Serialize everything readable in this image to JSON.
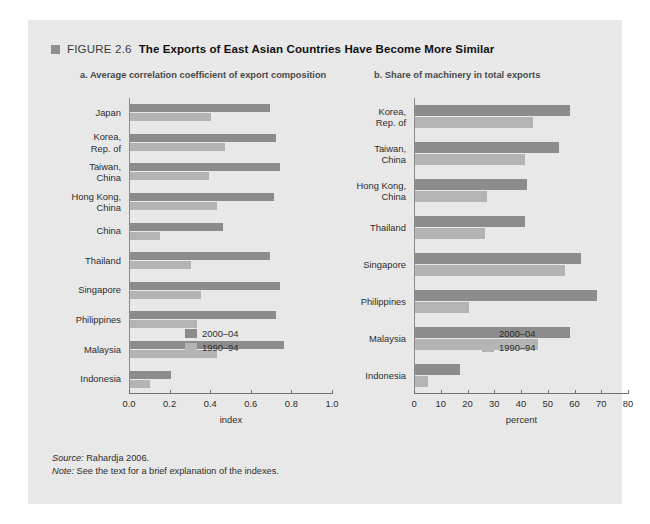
{
  "figure": {
    "marker": "square-marker-icon",
    "label": "FIGURE 2.6",
    "title": "The Exports of East Asian Countries Have Become More Similar"
  },
  "notes": {
    "source_key": "Source:",
    "source_value": " Rahardja 2006.",
    "note_key": "Note:",
    "note_value": " See the text for a brief explanation of the indexes."
  },
  "legend": {
    "new_label": "2000–04",
    "old_label": "1990–94",
    "new_color": "#8c8c8c",
    "old_color": "#b4b4b4"
  },
  "chart_data": [
    {
      "type": "bar",
      "panel": "a",
      "title": "a. Average correlation coefficient of export composition",
      "orientation": "horizontal",
      "xlabel": "index",
      "ylabel": "",
      "xlim": [
        0.0,
        1.0
      ],
      "ticks": [
        "0.0",
        "0.2",
        "0.4",
        "0.6",
        "0.8",
        "1.0"
      ],
      "tick_values": [
        0.0,
        0.2,
        0.4,
        0.6,
        0.8,
        1.0
      ],
      "grid": false,
      "legend_position": "inside-bottom-right",
      "categories": [
        "Japan",
        "Korea,\nRep. of",
        "Taiwan,\nChina",
        "Hong Kong,\nChina",
        "China",
        "Thailand",
        "Singapore",
        "Philippines",
        "Malaysia",
        "Indonesia"
      ],
      "series": [
        {
          "name": "2000–04",
          "values": [
            0.69,
            0.72,
            0.74,
            0.71,
            0.46,
            0.69,
            0.74,
            0.72,
            0.76,
            0.2
          ]
        },
        {
          "name": "1990–94",
          "values": [
            0.4,
            0.47,
            0.39,
            0.43,
            0.15,
            0.3,
            0.35,
            0.33,
            0.43,
            0.1
          ]
        }
      ]
    },
    {
      "type": "bar",
      "panel": "b",
      "title": "b. Share of machinery in total exports",
      "orientation": "horizontal",
      "xlabel": "percent",
      "ylabel": "",
      "xlim": [
        0,
        80
      ],
      "ticks": [
        "0",
        "10",
        "20",
        "30",
        "40",
        "50",
        "60",
        "70",
        "80"
      ],
      "tick_values": [
        0,
        10,
        20,
        30,
        40,
        50,
        60,
        70,
        80
      ],
      "grid": false,
      "legend_position": "inside-bottom-right",
      "categories": [
        "Korea,\nRep. of",
        "Taiwan,\nChina",
        "Hong Kong,\nChina",
        "Thailand",
        "Singapore",
        "Philippines",
        "Malaysia",
        "Indonesia"
      ],
      "series": [
        {
          "name": "2000–04",
          "values": [
            58,
            54,
            42,
            41,
            62,
            68,
            58,
            17
          ]
        },
        {
          "name": "1990–94",
          "values": [
            44,
            41,
            27,
            26,
            56,
            20,
            46,
            5
          ]
        }
      ]
    }
  ]
}
